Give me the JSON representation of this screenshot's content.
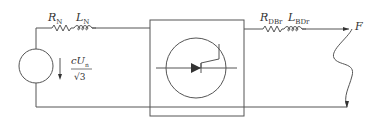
{
  "diagram": {
    "type": "circuit",
    "colors": {
      "line": "#555555",
      "text": "#333333",
      "background": "#ffffff"
    },
    "source": {
      "label_numerator_main": "cU",
      "label_numerator_sub": "n",
      "label_denominator": "√3"
    },
    "network_impedance": {
      "resistor_main": "R",
      "resistor_sub": "N",
      "inductor_main": "L",
      "inductor_sub": "N"
    },
    "converter_box": {
      "symbol": "thyristor-in-circle"
    },
    "line_impedance": {
      "resistor_main": "R",
      "resistor_sub": "DBr",
      "inductor_main": "L",
      "inductor_sub": "BDr"
    },
    "fault": {
      "label": "F"
    }
  }
}
